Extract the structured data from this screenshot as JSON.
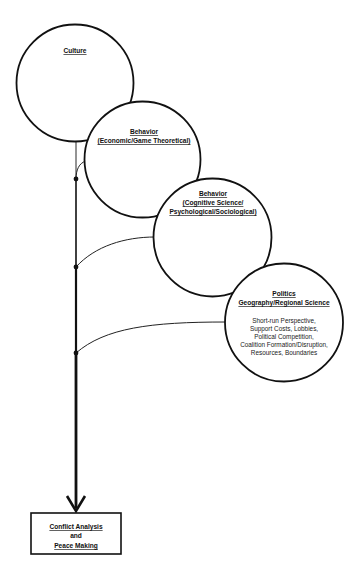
{
  "diagram": {
    "nodes": {
      "culture": {
        "title": "Culture"
      },
      "behavior_economic": {
        "title": "Behavior",
        "subtitle": "(Economic/Game Theoretical)"
      },
      "behavior_cognitive": {
        "title": "Behavior",
        "subtitle_line1": "(Cognitive Science/",
        "subtitle_line2": "Psychological/Sociological)"
      },
      "politics": {
        "title": "Politics",
        "subtitle": "Geography/Regional Science",
        "body": [
          "Short-run Perspective,",
          "Support Costs, Lobbies,",
          "Political Competition,",
          "Coalition Formation/Disruption,",
          "Resources, Boundaries"
        ]
      }
    },
    "target": {
      "line1": "Conflict Analysis",
      "line2": "and",
      "line3": "Peace Making"
    },
    "colors": {
      "stroke": "#111111",
      "background": "#ffffff"
    }
  }
}
